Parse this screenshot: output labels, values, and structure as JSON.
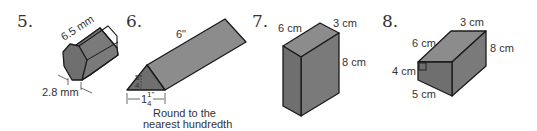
{
  "problems": [
    {
      "number": "5.",
      "shape": "hexagonal prism",
      "labels": {
        "length": "6.5 mm",
        "side": "2.8 mm"
      }
    },
    {
      "number": "6.",
      "shape": "triangular prism",
      "labels": {
        "length": "6\"",
        "height_num": "5\"",
        "height_den": "4",
        "base_whole": "1",
        "base_num": "1\"",
        "base_den": "4"
      },
      "note_line1": "Round to the",
      "note_line2": "nearest hundredth"
    },
    {
      "number": "7.",
      "shape": "rectangular prism",
      "labels": {
        "depth": "6 cm",
        "width": "3 cm",
        "height": "8 cm"
      }
    },
    {
      "number": "8.",
      "shape": "trapezoidal prism",
      "labels": {
        "top": "6 cm",
        "width": "3 cm",
        "height": "8 cm",
        "left": "4 cm",
        "bottom": "5 cm"
      }
    }
  ]
}
